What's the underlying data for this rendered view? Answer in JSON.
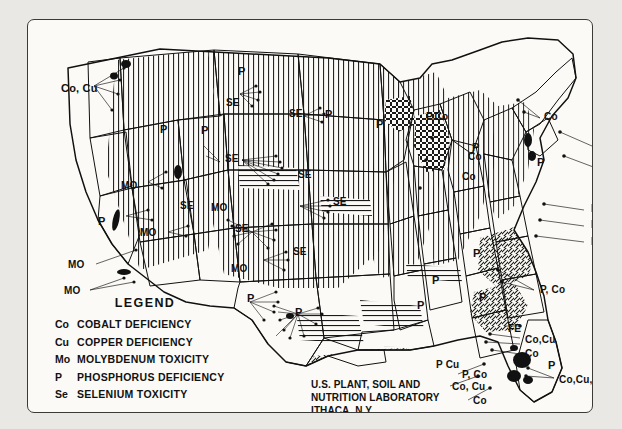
{
  "legend": {
    "heading": "LEGEND",
    "entries": [
      {
        "key": "Co",
        "desc": "Cobalt Deficiency"
      },
      {
        "key": "Cu",
        "desc": "Copper Deficiency"
      },
      {
        "key": "Mo",
        "desc": "Molybdenum Toxicity"
      },
      {
        "key": "P",
        "desc": "Phosphorus Deficiency"
      },
      {
        "key": "Se",
        "desc": "Selenium Toxicity"
      }
    ],
    "goiter_swatch_label": "Goiter Belt"
  },
  "credit": {
    "line1": "U.S. PLANT, SOIL AND",
    "line2": "NUTRITION LABORATORY",
    "line3": "ITHACA, N.Y."
  },
  "map_labels": [
    {
      "id": "co-cu-pacific-nw",
      "text": "Co, Cu",
      "x": 33,
      "y": 63,
      "size": "s11"
    },
    {
      "id": "p-montana",
      "text": "P",
      "x": 210,
      "y": 46,
      "size": "s11"
    },
    {
      "id": "se-dakota-n",
      "text": "SE",
      "x": 198,
      "y": 78,
      "size": "s10"
    },
    {
      "id": "se-montana-e",
      "text": "SE",
      "x": 261,
      "y": 89,
      "size": "s10"
    },
    {
      "id": "p-dakota-n",
      "text": "P",
      "x": 297,
      "y": 89,
      "size": "s11"
    },
    {
      "id": "p-idaho",
      "text": "P",
      "x": 132,
      "y": 104,
      "size": "s11"
    },
    {
      "id": "p-wyoming-n",
      "text": "P",
      "x": 173,
      "y": 105,
      "size": "s11"
    },
    {
      "id": "p-minnesota",
      "text": "P",
      "x": 348,
      "y": 99,
      "size": "s11"
    },
    {
      "id": "p-co-michigan-n",
      "text": "P,Co",
      "x": 398,
      "y": 92,
      "size": "s10"
    },
    {
      "id": "co-newengland-n",
      "text": "Co",
      "x": 516,
      "y": 92,
      "size": "s10"
    },
    {
      "id": "se-wyoming",
      "text": "SE",
      "x": 197,
      "y": 134,
      "size": "s10"
    },
    {
      "id": "co-maine",
      "text": "Co",
      "x": 569,
      "y": 121,
      "size": "s10"
    },
    {
      "id": "p-michigan",
      "text": "P",
      "x": 444,
      "y": 122,
      "size": "s11"
    },
    {
      "id": "co-michigan",
      "text": "Co",
      "x": 440,
      "y": 132,
      "size": "s10"
    },
    {
      "id": "co-newyork-e",
      "text": "Co",
      "x": 572,
      "y": 143,
      "size": "s10"
    },
    {
      "id": "mo-nevada-n",
      "text": "MO",
      "x": 93,
      "y": 161,
      "size": "s10"
    },
    {
      "id": "se-nebraska-n",
      "text": "SE",
      "x": 270,
      "y": 150,
      "size": "s10"
    },
    {
      "id": "co-ohio",
      "text": "Co",
      "x": 434,
      "y": 152,
      "size": "s10"
    },
    {
      "id": "p-newyork",
      "text": "P",
      "x": 509,
      "y": 137,
      "size": "s11"
    },
    {
      "id": "co-newengland-s",
      "text": "Co",
      "x": 569,
      "y": 159,
      "size": "s10"
    },
    {
      "id": "mo-nevada",
      "text": "MO",
      "x": 183,
      "y": 183,
      "size": "s10"
    },
    {
      "id": "se-utah",
      "text": "SE",
      "x": 152,
      "y": 181,
      "size": "s10"
    },
    {
      "id": "se-kansas",
      "text": "SE",
      "x": 305,
      "y": 177,
      "size": "s10"
    },
    {
      "id": "p-california-n",
      "text": "P",
      "x": 70,
      "y": 196,
      "size": "s11"
    },
    {
      "id": "se-colorado",
      "text": "SE",
      "x": 207,
      "y": 204,
      "size": "s10"
    },
    {
      "id": "mo-california-c",
      "text": "MO",
      "x": 112,
      "y": 208,
      "size": "s10"
    },
    {
      "id": "p-co-mid-atl1",
      "text": "P, Co",
      "x": 563,
      "y": 184,
      "size": "s10"
    },
    {
      "id": "p-co-cu-mid-atl1",
      "text": "P, Co,Cu",
      "x": 563,
      "y": 200,
      "size": "s10"
    },
    {
      "id": "p-co-cu-mid-atl2",
      "text": "P, Co,Cu",
      "x": 563,
      "y": 217,
      "size": "s10"
    },
    {
      "id": "se-oklahoma-n",
      "text": "SE",
      "x": 265,
      "y": 227,
      "size": "s10"
    },
    {
      "id": "mo-california-s",
      "text": "MO",
      "x": 40,
      "y": 240,
      "size": "s10"
    },
    {
      "id": "mo-newmexico",
      "text": "MO",
      "x": 203,
      "y": 244,
      "size": "s10"
    },
    {
      "id": "mo-california-sw",
      "text": "MO",
      "x": 36,
      "y": 266,
      "size": "s10"
    },
    {
      "id": "p-newmexico",
      "text": "P",
      "x": 219,
      "y": 273,
      "size": "s11"
    },
    {
      "id": "p-texas-n",
      "text": "P",
      "x": 267,
      "y": 287,
      "size": "s11"
    },
    {
      "id": "p-tennessee",
      "text": "P",
      "x": 404,
      "y": 255,
      "size": "s11"
    },
    {
      "id": "p-kentucky",
      "text": "P",
      "x": 445,
      "y": 228,
      "size": "s11"
    },
    {
      "id": "p-arkansas",
      "text": "P",
      "x": 389,
      "y": 280,
      "size": "s11"
    },
    {
      "id": "p-carolina",
      "text": "P",
      "x": 451,
      "y": 272,
      "size": "s11"
    },
    {
      "id": "p-co-virginia",
      "text": "P, Co",
      "x": 512,
      "y": 265,
      "size": "s10"
    },
    {
      "id": "fe-georgia",
      "text": "FE",
      "x": 480,
      "y": 304,
      "size": "s10"
    },
    {
      "id": "p-cu-louisiana",
      "text": "P Cu",
      "x": 408,
      "y": 340,
      "size": "s10"
    },
    {
      "id": "co-cu-georgia",
      "text": "Co,Cu",
      "x": 497,
      "y": 315,
      "size": "s10"
    },
    {
      "id": "co-georgia",
      "text": "Co",
      "x": 497,
      "y": 329,
      "size": "s10"
    },
    {
      "id": "p-co-alabama",
      "text": "P, Co",
      "x": 434,
      "y": 350,
      "size": "s10"
    },
    {
      "id": "co-cu-alabama",
      "text": "Co, Cu",
      "x": 424,
      "y": 362,
      "size": "s10"
    },
    {
      "id": "co-mississippi",
      "text": "Co",
      "x": 445,
      "y": 376,
      "size": "s10"
    },
    {
      "id": "p-florida-n",
      "text": "P",
      "x": 520,
      "y": 340,
      "size": "s11"
    },
    {
      "id": "co-cu-mo-florida",
      "text": "Co,Cu,Mo",
      "x": 531,
      "y": 355,
      "size": "s10"
    },
    {
      "id": "p-florida-s",
      "text": "P",
      "x": 488,
      "y": 391,
      "size": "s11"
    }
  ],
  "colors": {
    "ink": "#111111",
    "paper": "#fbfaf6",
    "outer": "#e9e8e4",
    "frame": "#3a3a38"
  }
}
